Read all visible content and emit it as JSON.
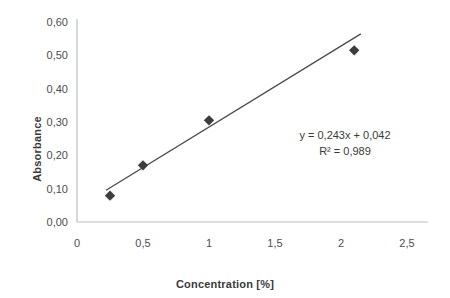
{
  "chart_data": {
    "type": "scatter",
    "title": "",
    "xlabel": "Concentration [%]",
    "ylabel": "Absorbance",
    "xlim": [
      0,
      2.5
    ],
    "ylim": [
      0.0,
      0.6
    ],
    "grid": false,
    "legend": "none",
    "x_ticks": [
      "0",
      "0,5",
      "1",
      "1,5",
      "2",
      "2,5"
    ],
    "x_tick_values": [
      0,
      0.5,
      1,
      1.5,
      2,
      2.5
    ],
    "y_ticks": [
      "0,00",
      "0,10",
      "0,20",
      "0,30",
      "0,40",
      "0,50",
      "0,60"
    ],
    "y_tick_values": [
      0.0,
      0.1,
      0.2,
      0.3,
      0.4,
      0.5,
      0.6
    ],
    "series": [
      {
        "name": "Absorbance",
        "marker": "diamond",
        "color": "#3d3d3d",
        "x": [
          0.25,
          0.5,
          1.0,
          2.1
        ],
        "y": [
          0.079,
          0.17,
          0.305,
          0.515
        ]
      }
    ],
    "trendline": {
      "type": "linear",
      "slope": 0.243,
      "intercept": 0.042,
      "r_squared": 0.989,
      "x_start": 0.22,
      "x_end": 2.15,
      "color": "#4a4a4a"
    },
    "annotations": {
      "equation": "y = 0,243x + 0,042",
      "r_squared": "R² = 0,989"
    },
    "axis_color": "#bfbfbf",
    "text_color": "#3a3a3a"
  }
}
